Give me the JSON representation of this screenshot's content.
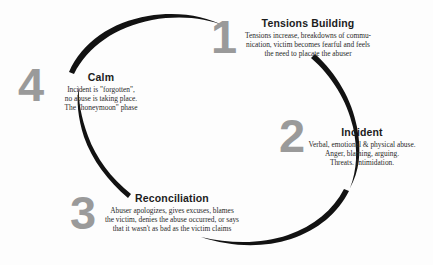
{
  "diagram": {
    "arrow_color": "#121212",
    "number_color": "#9a9a9a",
    "background_color": "#fdfdfd",
    "direction": "clockwise"
  },
  "phases": [
    {
      "number": "1",
      "title": "Tensions Building",
      "description": "Tensions increase, breakdowns of communication, victim becomes fearful and feels the need to placate the abuser",
      "lines": [
        "Tensions increase, breakdowns of commu-",
        "nication, victim becomes fearful and feels",
        "the need to placate the abuser"
      ]
    },
    {
      "number": "2",
      "title": "Incident",
      "description": "Verbal, emotional & physical abuse. Anger, blaming, arguing. Threats. Intimidation.",
      "lines": [
        "Verbal, emotional & physical abuse.",
        "Anger, blaming, arguing.",
        "Threats.  Intimidation."
      ]
    },
    {
      "number": "3",
      "title": "Reconciliation",
      "description": "Abuser apologizes, gives excuses, blames the victim, denies the abuse occurred, or says that it wasn't as bad as the victim claims",
      "lines": [
        "Abuser apologizes, gives excuses, blames",
        "the victim, denies the abuse occurred, or says",
        "that it wasn't as bad as the victim claims"
      ]
    },
    {
      "number": "4",
      "title": "Calm",
      "description": "Incident is \"forgotten\", no abuse is taking place. The \"honeymoon\" phase",
      "lines": [
        "Incident is \"forgotten\",",
        "no abuse is taking place.",
        "The \"honeymoon\" phase"
      ]
    }
  ]
}
